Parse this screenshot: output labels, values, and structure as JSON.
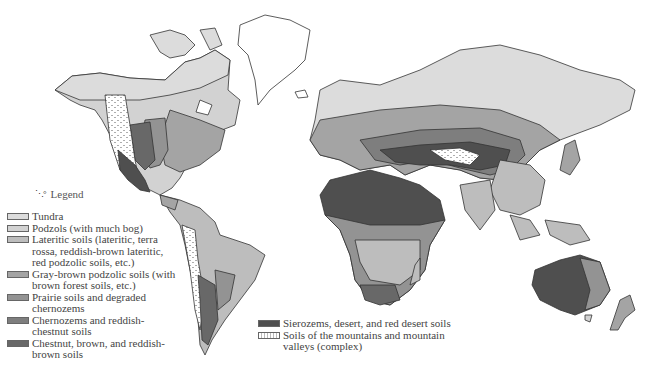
{
  "map": {
    "title": "World soil map",
    "legend_title": "Legend",
    "legend_icon": "island-dots-icon",
    "legend": [
      {
        "id": "tundra",
        "label": "Tundra",
        "color": "#dcdcdc"
      },
      {
        "id": "podzols",
        "label": "Podzols (with much bog)",
        "color": "#d2d2d2"
      },
      {
        "id": "lateritic",
        "label": "Lateritic soils (lateritic, terra rossa, reddish-brown lateritic, red podzolic soils, etc.)",
        "color": "#bdbdbd"
      },
      {
        "id": "gray-brown",
        "label": "Gray-brown podzolic soils (with brown forest soils, etc.)",
        "color": "#a4a4a4"
      },
      {
        "id": "prairie",
        "label": "Prairie soils and degraded chernozems",
        "color": "#939393"
      },
      {
        "id": "chernozems",
        "label": "Chernozems and reddish-chestnut soils",
        "color": "#7e7e7e"
      },
      {
        "id": "chestnut",
        "label": "Chestnut, brown, and reddish-brown soils",
        "color": "#686868"
      },
      {
        "id": "sierozems",
        "label": "Sierozems, desert, and red desert soils",
        "color": "#4f4f4f"
      },
      {
        "id": "mountains",
        "label": "Soils of the mountains and mountain valleys (complex)",
        "color": "#ffffff",
        "pattern": "dotted"
      }
    ]
  }
}
